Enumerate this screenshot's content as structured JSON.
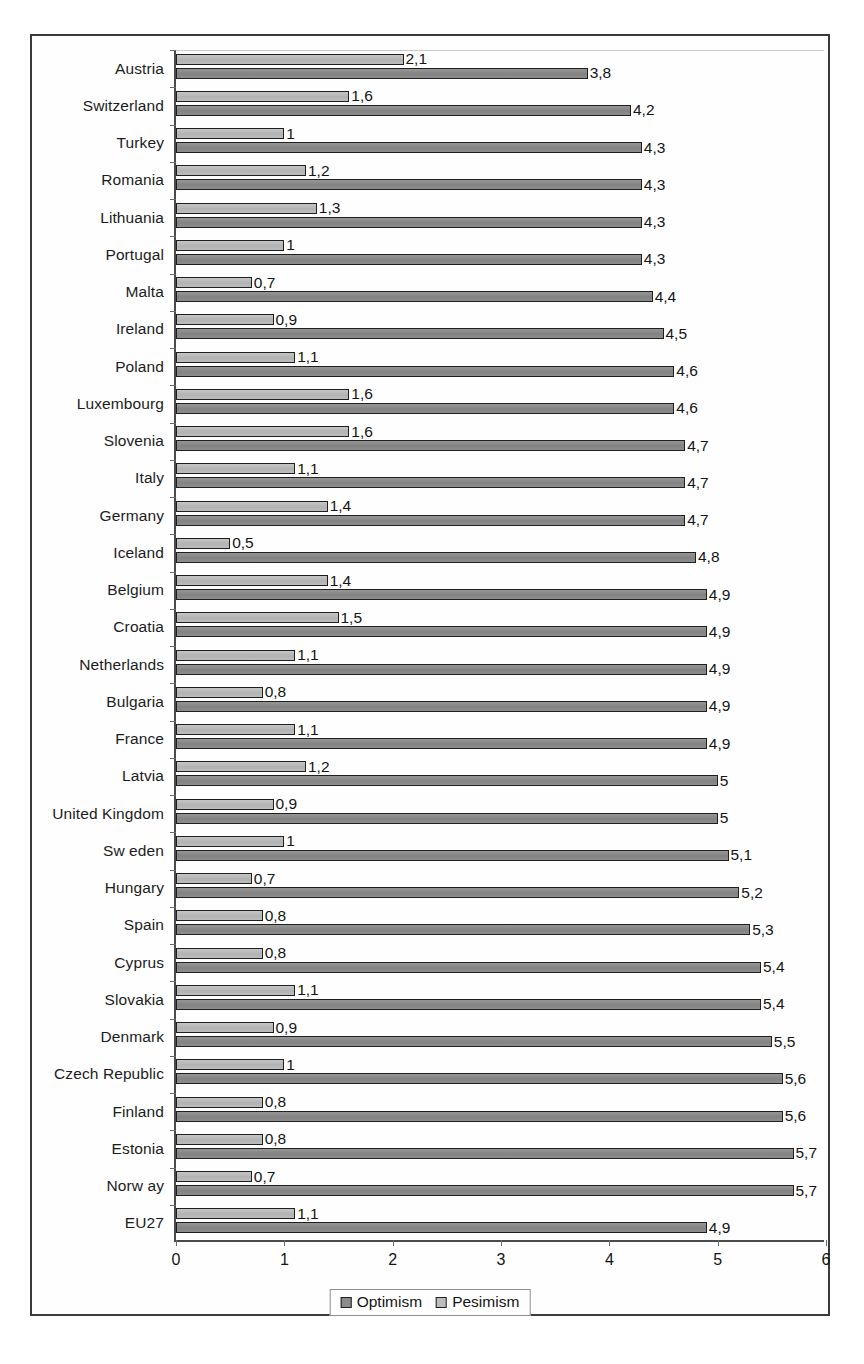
{
  "chart_data": {
    "type": "bar",
    "orientation": "horizontal",
    "title": "",
    "xlabel": "",
    "ylabel": "",
    "xlim": [
      0,
      6
    ],
    "xticks": [
      "0",
      "1",
      "2",
      "3",
      "4",
      "5",
      "6"
    ],
    "grid": false,
    "legend_position": "bottom-center",
    "decimal_separator": ",",
    "categories": [
      "Austria",
      "Switzerland",
      "Turkey",
      "Romania",
      "Lithuania",
      "Portugal",
      "Malta",
      "Ireland",
      "Poland",
      "Luxembourg",
      "Slovenia",
      "Italy",
      "Germany",
      "Iceland",
      "Belgium",
      "Croatia",
      "Netherlands",
      "Bulgaria",
      "France",
      "Latvia",
      "United Kingdom",
      "Sw eden",
      "Hungary",
      "Spain",
      "Cyprus",
      "Slovakia",
      "Denmark",
      "Czech Republic",
      "Finland",
      "Estonia",
      "Norw ay",
      "EU27"
    ],
    "series": [
      {
        "name": "Optimism",
        "color": "#8b8b8b",
        "values": [
          3.8,
          4.2,
          4.3,
          4.3,
          4.3,
          4.3,
          4.4,
          4.5,
          4.6,
          4.6,
          4.7,
          4.7,
          4.7,
          4.8,
          4.9,
          4.9,
          4.9,
          4.9,
          4.9,
          5,
          5,
          5.1,
          5.2,
          5.3,
          5.4,
          5.4,
          5.5,
          5.6,
          5.6,
          5.7,
          5.7,
          4.9
        ],
        "labels": [
          "3,8",
          "4,2",
          "4,3",
          "4,3",
          "4,3",
          "4,3",
          "4,4",
          "4,5",
          "4,6",
          "4,6",
          "4,7",
          "4,7",
          "4,7",
          "4,8",
          "4,9",
          "4,9",
          "4,9",
          "4,9",
          "4,9",
          "5",
          "5",
          "5,1",
          "5,2",
          "5,3",
          "5,4",
          "5,4",
          "5,5",
          "5,6",
          "5,6",
          "5,7",
          "5,7",
          "4,9"
        ]
      },
      {
        "name": "Pesimism",
        "color": "#bdbdbd",
        "values": [
          2.1,
          1.6,
          1,
          1.2,
          1.3,
          1,
          0.7,
          0.9,
          1.1,
          1.6,
          1.6,
          1.1,
          1.4,
          0.5,
          1.4,
          1.5,
          1.1,
          0.8,
          1.1,
          1.2,
          0.9,
          1,
          0.7,
          0.8,
          0.8,
          1.1,
          0.9,
          1,
          0.8,
          0.8,
          0.7,
          1.1
        ],
        "labels": [
          "2,1",
          "1,6",
          "1",
          "1,2",
          "1,3",
          "1",
          "0,7",
          "0,9",
          "1,1",
          "1,6",
          "1,6",
          "1,1",
          "1,4",
          "0,5",
          "1,4",
          "1,5",
          "1,1",
          "0,8",
          "1,1",
          "1,2",
          "0,9",
          "1",
          "0,7",
          "0,8",
          "0,8",
          "1,1",
          "0,9",
          "1",
          "0,8",
          "0,8",
          "0,7",
          "1,1"
        ]
      }
    ],
    "legend": [
      {
        "label": "Optimism",
        "swatch": "dark-gray"
      },
      {
        "label": "Pesimism",
        "swatch": "light-gray"
      }
    ]
  }
}
